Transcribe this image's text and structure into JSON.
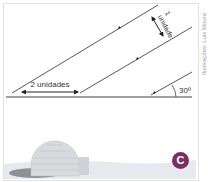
{
  "figure": {
    "labels": {
      "vertical_gap": "1 unidade",
      "vertical_gap_number": "1",
      "vertical_gap_word": "unidade",
      "horizontal_gap": "2 unidades",
      "angle": "30º"
    },
    "credit": "Ilustrações: Luis Moura",
    "badge": "C",
    "colors": {
      "line": "#333333",
      "badge": "#7a2e63",
      "snow": "#e9ecef",
      "igloo": "#d6d8da"
    }
  }
}
